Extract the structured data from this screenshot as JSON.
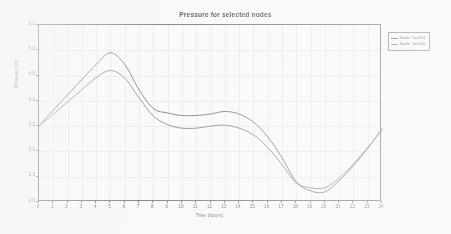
{
  "chart_data": {
    "type": "line",
    "title": "Pressure for selected nodes",
    "xlabel": "Time (hours)",
    "ylabel": "Pressure (m)",
    "xlim": [
      0,
      24
    ],
    "ylim": [
      2.0,
      5.5
    ],
    "grid": true,
    "legend_position": "right-outside",
    "xticks": [
      0,
      1,
      2,
      3,
      4,
      5,
      6,
      7,
      8,
      9,
      10,
      11,
      12,
      13,
      14,
      15,
      16,
      17,
      18,
      19,
      20,
      21,
      22,
      23,
      24
    ],
    "xtick_labels": [
      "0",
      "1",
      "2",
      "3",
      "4",
      "5",
      "6",
      "7",
      "8",
      "9",
      "10",
      "11",
      "12",
      "13",
      "14",
      "15",
      "16",
      "17",
      "18",
      "19",
      "20",
      "21",
      "22",
      "23",
      "24"
    ],
    "yticks": [
      2.0,
      2.5,
      3.0,
      3.5,
      4.0,
      4.5,
      5.0,
      5.5
    ],
    "ytick_labels": [
      "2.0",
      "2.5",
      "3.0",
      "3.5",
      "4.0",
      "4.5",
      "5.0",
      "5.5"
    ],
    "x": [
      0,
      1,
      2,
      3,
      4,
      5,
      6,
      7,
      8,
      9,
      10,
      11,
      12,
      13,
      14,
      15,
      16,
      17,
      18,
      19,
      20,
      21,
      22,
      23,
      24
    ],
    "series": [
      {
        "name": "Node Tank51",
        "color": "#555558",
        "values": [
          3.5,
          3.82,
          4.12,
          4.42,
          4.72,
          4.95,
          4.72,
          4.22,
          3.85,
          3.76,
          3.71,
          3.71,
          3.74,
          3.79,
          3.74,
          3.58,
          3.29,
          2.88,
          2.4,
          2.22,
          2.2,
          2.42,
          2.72,
          3.06,
          3.45
        ]
      },
      {
        "name": "Node Tank52",
        "color": "#6a6a6e",
        "values": [
          3.5,
          3.74,
          3.98,
          4.22,
          4.46,
          4.6,
          4.45,
          4.06,
          3.7,
          3.53,
          3.46,
          3.46,
          3.5,
          3.52,
          3.46,
          3.33,
          3.08,
          2.74,
          2.38,
          2.28,
          2.28,
          2.47,
          2.75,
          3.08,
          3.42
        ]
      }
    ]
  },
  "legend": {
    "entries": [
      {
        "label": "Node Tank51"
      },
      {
        "label": "Node Tank52"
      }
    ]
  }
}
